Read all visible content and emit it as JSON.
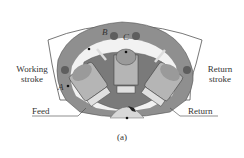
{
  "figure": {
    "caption": "(a)",
    "labels": {
      "working_stroke": [
        "Working",
        "stroke"
      ],
      "return_stroke": [
        "Return",
        "stroke"
      ],
      "feed": "Feed",
      "return": "Return"
    },
    "points": {
      "a": "A",
      "b": "B",
      "c": "C"
    },
    "colors": {
      "housing": "#8f8f8f",
      "housing_dark": "#6e6e6e",
      "outline": "#555555",
      "piston_light": "#c8c8c8",
      "piston_mid": "#9a9a9a",
      "gear": "#d8d8d8",
      "hole": "#5e5e5e"
    }
  }
}
